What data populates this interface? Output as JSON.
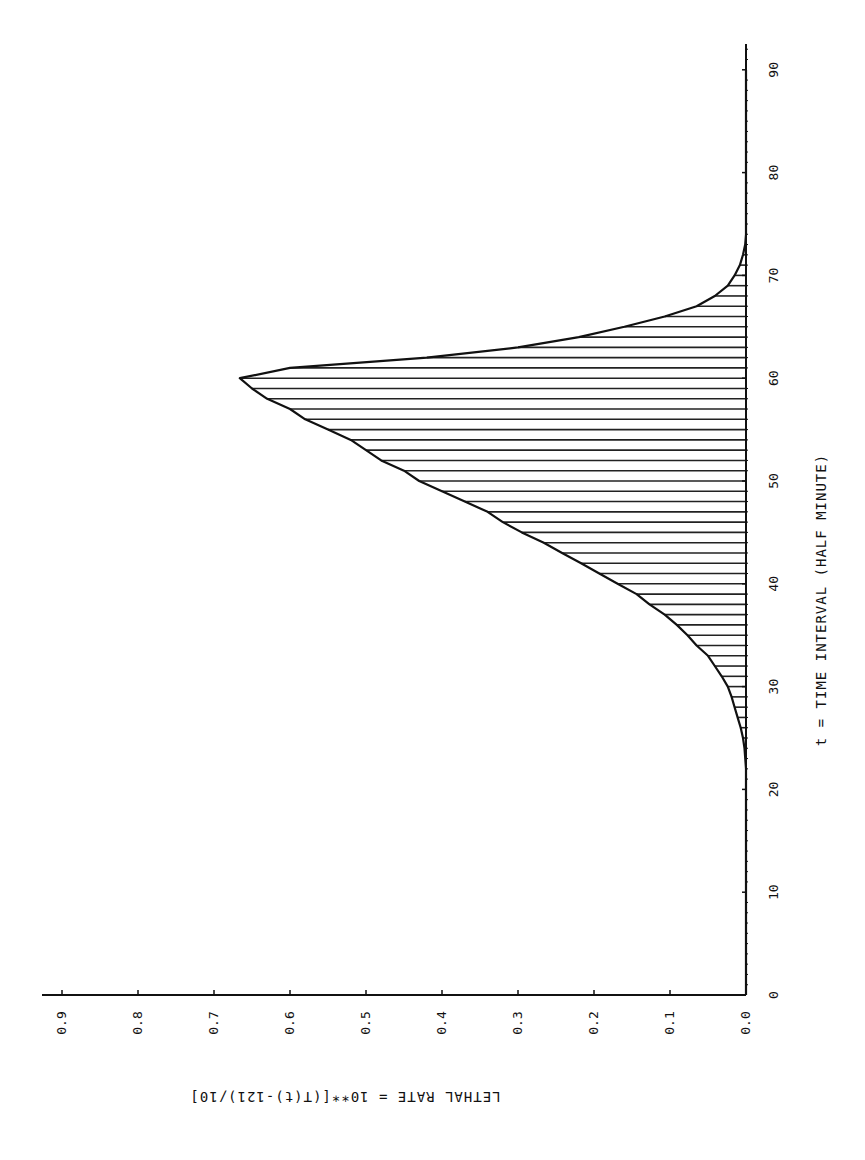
{
  "chart_data": {
    "type": "area",
    "orientation": "rotated-90",
    "title": "",
    "xlabel": "t = TIME INTERVAL (HALF MINUTE)",
    "ylabel": "LETHAL RATE = 10**[(T(t)-121)/10]",
    "xlim": [
      0,
      92
    ],
    "ylim": [
      0,
      0.93
    ],
    "x_ticks": [
      0,
      10,
      20,
      30,
      40,
      50,
      60,
      70,
      80,
      90
    ],
    "x_tick_labels": [
      "0",
      "10",
      "20",
      "30",
      "40",
      "50",
      "60",
      "70",
      "80",
      "90"
    ],
    "y_ticks": [
      0.0,
      0.1,
      0.2,
      0.3,
      0.4,
      0.5,
      0.6,
      0.7,
      0.8,
      0.9
    ],
    "y_tick_labels": [
      "0.0",
      "0.1",
      "0.2",
      "0.3",
      "0.4",
      "0.5",
      "0.6",
      "0.7",
      "0.8",
      "0.9"
    ],
    "grid": false,
    "legend": null,
    "fill": "horizontal hatch under curve",
    "series": [
      {
        "name": "Lethal rate",
        "x": [
          0,
          22,
          24,
          25,
          26,
          27,
          28,
          29,
          30,
          31,
          32,
          33,
          34,
          35,
          36,
          37,
          38,
          39,
          40,
          41,
          42,
          43,
          44,
          45,
          46,
          47,
          48,
          49,
          50,
          51,
          52,
          53,
          54,
          55,
          56,
          57,
          58,
          59,
          60,
          61,
          62,
          63,
          64,
          65,
          66,
          67,
          68,
          69,
          70,
          71,
          72,
          73,
          74,
          90
        ],
        "values": [
          0.0,
          0.0,
          0.002,
          0.004,
          0.007,
          0.011,
          0.015,
          0.019,
          0.024,
          0.032,
          0.041,
          0.05,
          0.065,
          0.077,
          0.091,
          0.107,
          0.127,
          0.144,
          0.169,
          0.193,
          0.217,
          0.242,
          0.266,
          0.295,
          0.32,
          0.34,
          0.37,
          0.4,
          0.43,
          0.45,
          0.48,
          0.5,
          0.52,
          0.55,
          0.58,
          0.6,
          0.63,
          0.65,
          0.666,
          0.6,
          0.42,
          0.3,
          0.22,
          0.16,
          0.107,
          0.065,
          0.041,
          0.024,
          0.015,
          0.008,
          0.004,
          0.001,
          0.0,
          0.0
        ]
      }
    ]
  },
  "colors": {
    "ink": "#111111",
    "background": "#ffffff"
  }
}
